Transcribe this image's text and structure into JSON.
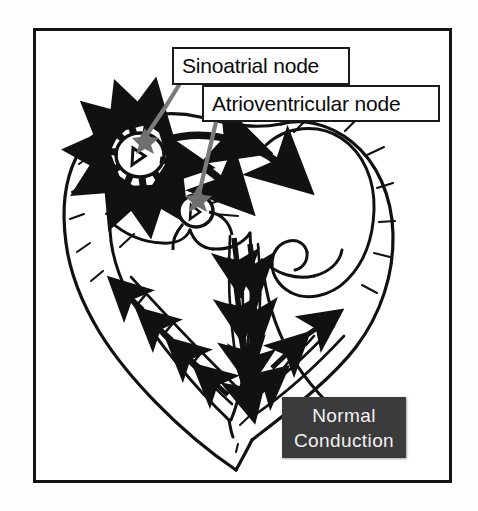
{
  "figure": {
    "border_color": "#141414",
    "background_color": "#ffffff"
  },
  "callouts": [
    {
      "id": "sinoatrial-node",
      "label": "Sinoatrial node",
      "box": {
        "x": 172,
        "y": 47,
        "w": 178,
        "h": 38
      },
      "leader_from": {
        "x": 178,
        "y": 85
      },
      "leader_to": {
        "x": 145,
        "y": 137
      },
      "marker": {
        "x": 145,
        "y": 137,
        "color": "#6f6f6f"
      }
    },
    {
      "id": "atrioventricular-node",
      "label": "Atrioventricular node",
      "box": {
        "x": 202,
        "y": 85,
        "w": 238,
        "h": 37
      },
      "leader_from": {
        "x": 216,
        "y": 122
      },
      "leader_to": {
        "x": 198,
        "y": 195
      },
      "marker": {
        "x": 198,
        "y": 195,
        "color": "#6f6f6f"
      }
    }
  ],
  "badge": {
    "line1": "Normal",
    "line2": "Conduction",
    "background_color": "#3b3b3b",
    "text_color": "#f2f2f2"
  },
  "diagram": {
    "ink_color": "#111111",
    "leader_color": "#7a7a7a",
    "node_marker_color": "#6f6f6f",
    "nodes": [
      {
        "name": "sinoatrial-node",
        "cx": 140,
        "cy": 155,
        "rx": 24,
        "ry": 22
      },
      {
        "name": "atrioventricular-node",
        "cx": 196,
        "cy": 211,
        "rx": 17,
        "ry": 16
      }
    ],
    "arrow_groups": [
      {
        "name": "sa-radiating-arrows",
        "count": 9
      },
      {
        "name": "atrial-conduction-arrows",
        "count": 4
      },
      {
        "name": "bundle-branch-arrows",
        "count": 6
      },
      {
        "name": "purkinje-left-arrows",
        "count": 4
      },
      {
        "name": "purkinje-right-arrows",
        "count": 3
      }
    ]
  }
}
